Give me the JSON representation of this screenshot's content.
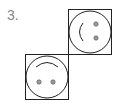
{
  "problem": {
    "number_label": "3.",
    "figures": [
      {
        "name": "top-right-face",
        "rotation": "sideways",
        "mouth": "arc-left",
        "eyes": "vertical-right"
      },
      {
        "name": "bottom-left-face",
        "rotation": "upside-down",
        "mouth": "arc-top",
        "eyes": "horizontal-bottom"
      }
    ]
  },
  "colors": {
    "stroke": "#222222",
    "eye": "#999999",
    "label": "#888888"
  }
}
